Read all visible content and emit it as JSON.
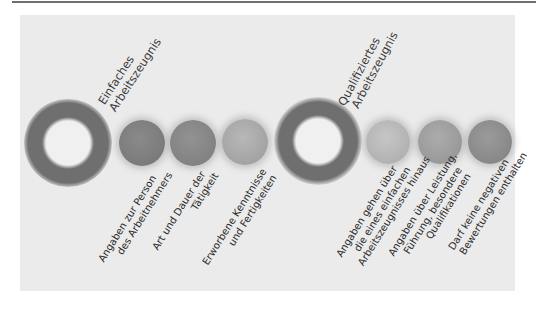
{
  "figure": {
    "groups": [
      {
        "title_lines": [
          "Einfaches",
          "Arbeitszeugnis"
        ],
        "items": [
          {
            "lines": [
              "Angaben zur Person",
              "des Arbeitnehmers"
            ],
            "color": "#7d7d7d"
          },
          {
            "lines": [
              "Art und Dauer der",
              "Tätigkeit"
            ],
            "color": "#858585"
          },
          {
            "lines": [
              "Erworbene Kenntnisse",
              "und Fertigkeiten"
            ],
            "color": "#a5a5a5"
          }
        ]
      },
      {
        "title_lines": [
          "Qualifiziertes",
          "Arbeitszeugnis"
        ],
        "items": [
          {
            "lines": [
              "Angaben gehen über",
              "die eines einfachen",
              "Arbeitszeugnisses hinaus"
            ],
            "color": "#b4b4b4"
          },
          {
            "lines": [
              "Angaben über Leistung,",
              "Führung, besondere",
              "Qualifikationen"
            ],
            "color": "#9c9c9c"
          },
          {
            "lines": [
              "Darf keine negativen",
              "Bewertungen enthalten"
            ],
            "color": "#8a8a8a"
          }
        ]
      }
    ],
    "colors": {
      "panel_bg": "#ebebeb",
      "ring": "#6f6f6f",
      "ring_hole": "#efefef",
      "text": "#2b2b2b",
      "rule": "#6e6e6e"
    }
  }
}
